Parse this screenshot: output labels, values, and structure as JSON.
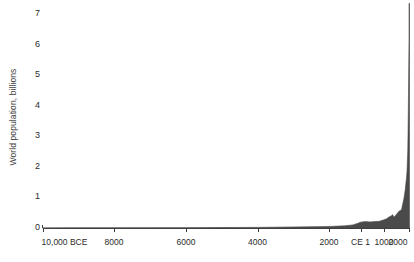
{
  "chart_data": {
    "type": "area",
    "title": "",
    "subtitle": "",
    "xlabel": "",
    "ylabel": "World population, billions",
    "ylim": [
      0,
      7.4
    ],
    "y_ticks": [
      0,
      1,
      2,
      3,
      4,
      5,
      6,
      7
    ],
    "y_tick_labels": [
      "0",
      "1",
      "2",
      "3",
      "4",
      "5",
      "6",
      "7"
    ],
    "x_tick_labels": [
      "10,000 BCE",
      "8000",
      "6000",
      "4000",
      "2000",
      "CE 1",
      "1000",
      "2000"
    ],
    "x_tick_years": [
      -10000,
      -8000,
      -6000,
      -4000,
      -2000,
      1,
      1000,
      2000
    ],
    "x_axis_note": "non-linear: prehistoric span compressed left, common era expanded right",
    "grid": false,
    "legend": null,
    "series_color": "#4a4a4a",
    "axis_color": "#3a3a3a",
    "series": [
      {
        "name": "World population",
        "unit": "billions",
        "x": [
          -10000,
          -9000,
          -8000,
          -7000,
          -6000,
          -5000,
          -4000,
          -3000,
          -2000,
          -1000,
          -500,
          -200,
          1,
          200,
          400,
          600,
          800,
          1000,
          1100,
          1200,
          1300,
          1340,
          1400,
          1500,
          1600,
          1700,
          1750,
          1800,
          1850,
          1900,
          1920,
          1940,
          1950,
          1960,
          1970,
          1980,
          1990,
          2000,
          2010,
          2015
        ],
        "values": [
          0.004,
          0.005,
          0.005,
          0.007,
          0.01,
          0.015,
          0.02,
          0.035,
          0.05,
          0.072,
          0.1,
          0.15,
          0.19,
          0.21,
          0.2,
          0.21,
          0.22,
          0.27,
          0.3,
          0.36,
          0.4,
          0.44,
          0.35,
          0.45,
          0.55,
          0.6,
          0.79,
          0.98,
          1.26,
          1.65,
          1.86,
          2.3,
          2.53,
          3.03,
          3.7,
          4.45,
          5.32,
          6.14,
          6.96,
          7.35
        ]
      }
    ]
  }
}
